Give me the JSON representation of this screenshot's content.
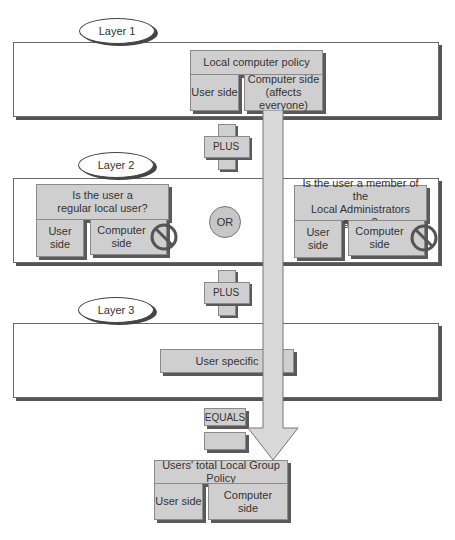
{
  "layer1": {
    "label": "Layer 1",
    "policy_title": "Local computer policy",
    "user_side": "User side",
    "computer_side_line1": "Computer side",
    "computer_side_line2": "(affects everyone)"
  },
  "connector1": {
    "label": "PLUS"
  },
  "layer2": {
    "label": "Layer 2",
    "left_group": {
      "title_line1": "Is the user a",
      "title_line2": "regular local user?",
      "user_side": "User side",
      "computer_side_line1": "Computer",
      "computer_side_line2": "side"
    },
    "or_label": "OR",
    "right_group": {
      "title_line1": "Is the user a member of the",
      "title_line2": "Local Administrators group?",
      "user_side": "User side",
      "computer_side_line1": "Computer",
      "computer_side_line2": "side"
    }
  },
  "connector2": {
    "label": "PLUS"
  },
  "layer3": {
    "label": "Layer 3",
    "user_specific": "User specific"
  },
  "connector3": {
    "label": "EQUALS"
  },
  "result": {
    "title": "Users' total Local Group Policy",
    "user_side": "User side",
    "computer_side_line1": "Computer",
    "computer_side_line2": "side"
  },
  "colors": {
    "box_fill": "#cfcfcf",
    "shadow": "#555555",
    "arrow_fill": "#d8d8d8"
  }
}
